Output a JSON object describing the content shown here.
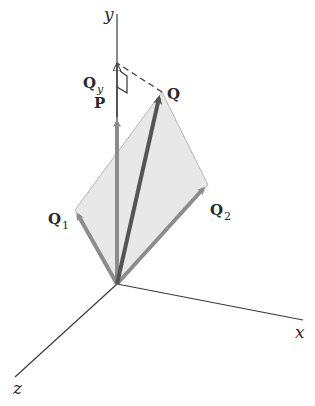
{
  "diagram": {
    "type": "3d-vector-decomposition",
    "axes": {
      "x_label": "x",
      "y_label": "y",
      "z_label": "z"
    },
    "vectors": {
      "P": {
        "label": "P",
        "role": "vertical vector along y-axis"
      },
      "Q": {
        "label": "Q",
        "role": "resultant vector"
      },
      "Q1": {
        "label": "Q",
        "subscript": "1",
        "role": "component"
      },
      "Q2": {
        "label": "Q",
        "subscript": "2",
        "role": "component"
      },
      "Qy": {
        "label": "Q",
        "subscript": "y",
        "role": "projection of Q on y-axis"
      }
    },
    "colors": {
      "axis": "#3a3a3a",
      "resultant": "#555555",
      "component": "#8c8c8c",
      "plane_fill": "#e6e6e6",
      "label": "#2a2a2a"
    }
  }
}
